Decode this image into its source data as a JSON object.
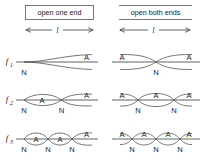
{
  "figure": {
    "type": "diagram",
    "background_color": "#ffffff",
    "line_color": "#4a4a4a"
  },
  "columns": [
    {
      "id": "open-one-end",
      "header": "open one end",
      "length_label": "l",
      "boxed": true
    },
    {
      "id": "open-both-ends",
      "header": "open both ends",
      "length_label": "l",
      "boxed": false
    }
  ],
  "rows": [
    {
      "id": "f1",
      "label": "f",
      "subscript": "1"
    },
    {
      "id": "f2",
      "label": "f",
      "subscript": "2"
    },
    {
      "id": "f3",
      "label": "f",
      "subscript": "3"
    }
  ],
  "node_label": "N",
  "antinode_label": "A",
  "patterns": {
    "open-one-end": {
      "f1": {
        "lobes": 1,
        "node_labels": [
          "N"
        ],
        "antinode_labels": [
          "A"
        ]
      },
      "f2": {
        "lobes": 2,
        "node_labels": [
          "N",
          "N"
        ],
        "antinode_labels": [
          "A",
          "A"
        ]
      },
      "f3": {
        "lobes": 3,
        "node_labels": [
          "N",
          "N",
          "N"
        ],
        "antinode_labels": [
          "A",
          "A",
          "A"
        ]
      }
    },
    "open-both-ends": {
      "f1": {
        "lobes": 1,
        "node_labels": [
          "N"
        ],
        "antinode_labels": [
          "A",
          "A"
        ]
      },
      "f2": {
        "lobes": 2,
        "node_labels": [
          "N",
          "N"
        ],
        "antinode_labels": [
          "A",
          "A",
          "A"
        ]
      },
      "f3": {
        "lobes": 3,
        "node_labels": [
          "N",
          "N",
          "N"
        ],
        "antinode_labels": [
          "A",
          "A",
          "A",
          "A"
        ]
      }
    }
  },
  "labels": {
    "col1_header": "open one end",
    "col2_header": "open both ends",
    "length1": "l",
    "length2": "l",
    "f1": "f",
    "f1_sub": "1",
    "f2": "f",
    "f2_sub": "2",
    "f3": "f",
    "f3_sub": "3",
    "N": "N",
    "A": "A"
  }
}
